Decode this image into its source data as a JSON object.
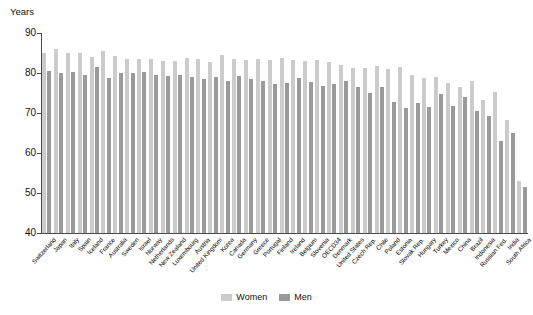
{
  "chart_data": {
    "type": "bar",
    "title": "",
    "subtitle": "",
    "xlabel": "",
    "ylabel": "Years",
    "ylim": [
      40,
      90
    ],
    "yticks": [
      40,
      50,
      60,
      70,
      80,
      90
    ],
    "grid": false,
    "legend_position": "bottom-center",
    "categories": [
      "Switzerland",
      "Japan",
      "Italy",
      "Spain",
      "Iceland",
      "France",
      "Australia",
      "Sweden",
      "Israel",
      "Norway",
      "Netherlands",
      "New Zealand",
      "Luxembourg",
      "Austria",
      "United Kingdom",
      "Korea",
      "Canada",
      "Germany",
      "Greece",
      "Portugal",
      "Finland",
      "Ireland",
      "Belgium",
      "Slovenia",
      "OECD34",
      "Denmark",
      "United States",
      "Czech Rep.",
      "Chile",
      "Poland",
      "Estonia",
      "Slovak Rep.",
      "Hungary",
      "Turkey",
      "Mexico",
      "China",
      "Brazil",
      "Indonesia",
      "Russian Fed.",
      "India",
      "South Africa"
    ],
    "series": [
      {
        "name": "Women",
        "color": "#cbcbcb",
        "values": [
          84.9,
          86.0,
          85.0,
          85.1,
          83.9,
          85.4,
          84.3,
          83.6,
          83.6,
          83.5,
          83.0,
          83.0,
          83.8,
          83.6,
          82.8,
          84.6,
          83.6,
          83.2,
          83.4,
          83.2,
          83.7,
          83.2,
          83.0,
          83.3,
          82.8,
          82.1,
          81.2,
          81.2,
          81.7,
          81.1,
          81.5,
          79.6,
          78.7,
          79.0,
          77.5,
          76.6,
          77.9,
          73.2,
          75.3,
          68.3,
          53.1
        ]
      },
      {
        "name": "Men",
        "color": "#9a9a9a",
        "values": [
          80.5,
          79.9,
          80.2,
          79.5,
          81.6,
          78.7,
          80.1,
          79.9,
          80.3,
          79.5,
          79.3,
          79.5,
          79.1,
          78.4,
          79.1,
          77.9,
          79.3,
          78.6,
          78.0,
          77.3,
          77.5,
          78.7,
          77.8,
          76.8,
          77.3,
          78.1,
          76.4,
          75.1,
          76.5,
          72.7,
          71.2,
          72.5,
          71.6,
          74.7,
          71.7,
          74.0,
          70.5,
          69.3,
          63.0,
          65.1,
          51.5
        ]
      }
    ],
    "legend": [
      {
        "label": "Women",
        "color": "#cbcbcb"
      },
      {
        "label": "Men",
        "color": "#9a9a9a"
      }
    ]
  }
}
